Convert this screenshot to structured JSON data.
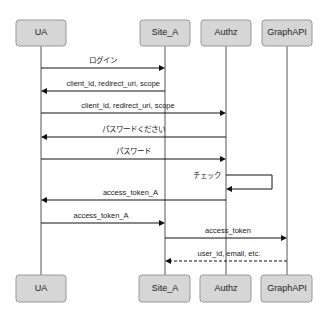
{
  "diagram": {
    "type": "sequence",
    "actors": [
      {
        "id": "ua",
        "label": "UA",
        "x": 41
      },
      {
        "id": "site_a",
        "label": "Site_A",
        "x": 165
      },
      {
        "id": "authz",
        "label": "Authz",
        "x": 226
      },
      {
        "id": "graphapi",
        "label": "GraphAPI",
        "x": 287
      }
    ],
    "messages": [
      {
        "from": "ua",
        "to": "site_a",
        "label": "ログイン",
        "y": 68,
        "style": "solid"
      },
      {
        "from": "site_a",
        "to": "ua",
        "label": "client_id, redirect_uri, scope",
        "y": 91,
        "style": "solid"
      },
      {
        "from": "ua",
        "to": "authz",
        "label": "client_id, redirect_uri, scope",
        "y": 113,
        "style": "solid"
      },
      {
        "from": "authz",
        "to": "ua",
        "label": "パスワードください",
        "y": 137,
        "style": "solid"
      },
      {
        "from": "ua",
        "to": "authz",
        "label": "パスワード",
        "y": 159,
        "style": "solid"
      },
      {
        "from": "authz",
        "to": "authz",
        "label": "チェック",
        "y": 175,
        "y2": 189,
        "style": "self"
      },
      {
        "from": "authz",
        "to": "ua",
        "label": "access_token_A",
        "y": 200,
        "style": "solid"
      },
      {
        "from": "ua",
        "to": "site_a",
        "label": "access_token_A",
        "y": 223,
        "style": "solid"
      },
      {
        "from": "site_a",
        "to": "graphapi",
        "label": "access_token",
        "y": 238,
        "style": "solid"
      },
      {
        "from": "graphapi",
        "to": "site_a",
        "label": "user_id, email, etc.",
        "y": 261,
        "style": "dashed"
      }
    ],
    "colors": {
      "box_fill": "#d6d6d6",
      "box_stroke": "#9a9a9a",
      "line": "#111111"
    }
  }
}
